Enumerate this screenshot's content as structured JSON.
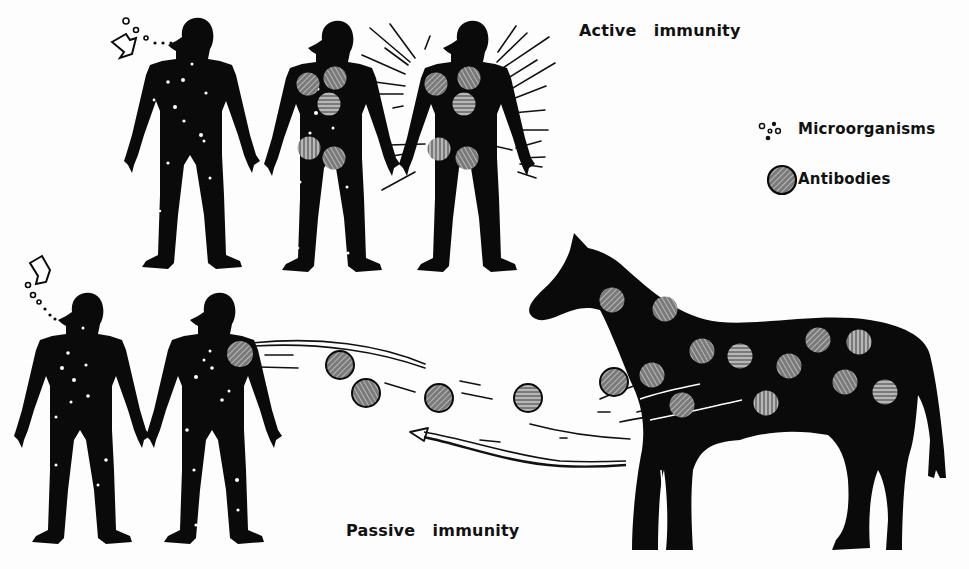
{
  "figure": {
    "type": "illustration",
    "colors": {
      "silhouette": "#0a0a0a",
      "antibody_fill": "#7a7a7a",
      "antibody_hatch": "#d8d8d8",
      "background": "#fdfdfd"
    }
  },
  "titles": {
    "active": "Active   immunity",
    "passive": "Passive   immunity"
  },
  "legend": {
    "items": [
      {
        "icon": "microorganisms-icon",
        "label": "Microorganisms"
      },
      {
        "icon": "antibody-icon",
        "label": "Antibodies"
      }
    ]
  },
  "active_row": {
    "figures": [
      {
        "name": "person-infected",
        "state": "inhaling microorganisms",
        "antibodies": 0
      },
      {
        "name": "person-producing-antibodies",
        "state": "antibodies forming",
        "antibodies": 5
      },
      {
        "name": "person-immune",
        "state": "radiating immunity",
        "antibodies": 5
      }
    ]
  },
  "passive_row": {
    "figures": [
      {
        "name": "person-infected",
        "state": "inhaling microorganisms",
        "antibodies": 0
      },
      {
        "name": "person-receiving-antibodies",
        "state": "receiving antibodies",
        "antibodies": 1
      },
      {
        "name": "horse-donor",
        "state": "antibody donor",
        "antibodies": 14
      }
    ],
    "antibodies_in_transit": 5
  }
}
